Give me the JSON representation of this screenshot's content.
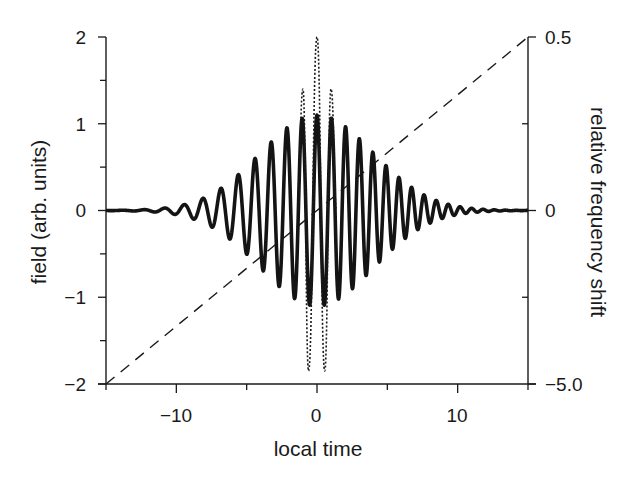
{
  "chart_data": {
    "type": "line",
    "title": "",
    "xlabel": "local time",
    "ylabel": "field (arb. units)",
    "ylabel_right": "relative frequency shift",
    "xlim": [
      -15,
      15
    ],
    "ylim": [
      -2,
      2
    ],
    "ylim_right_labels": [
      "-5.0",
      "0",
      "0.5"
    ],
    "grid": false,
    "legend": null,
    "x_ticks": [
      {
        "value": -10,
        "label": "−10"
      },
      {
        "value": 0,
        "label": "0"
      },
      {
        "value": 10,
        "label": "10"
      }
    ],
    "x_minor_ticks": [
      -15,
      -5,
      5,
      15
    ],
    "y_ticks": [
      {
        "value": 2,
        "label": "2"
      },
      {
        "value": 1,
        "label": "1"
      },
      {
        "value": 0,
        "label": "0"
      },
      {
        "value": -1,
        "label": "−1"
      },
      {
        "value": -2,
        "label": "−2"
      }
    ],
    "y_minor_ticks": [
      1.5,
      0.5,
      -0.5,
      -1.5
    ],
    "y_right_ticks": [
      {
        "value": 2,
        "label": "0.5"
      },
      {
        "value": 0,
        "label": "0"
      },
      {
        "value": -2,
        "label": "−5.0"
      }
    ],
    "y_right_minor_ticks": [
      1,
      -1
    ],
    "series": [
      {
        "name": "chirped pulse field",
        "style": "solid-thick",
        "model": "A*exp(-t^2/(2*sigma^2))*cos(w0*t + 0.5*beta*t^2)",
        "params": {
          "A": 1.1,
          "sigma": 4.0,
          "w0": 6.03,
          "beta": 0.15
        },
        "t_range": [
          -15,
          15
        ],
        "approx_peaks": [
          {
            "t": -9.4,
            "v": 0.1
          },
          {
            "t": -8.1,
            "v": 0.2
          },
          {
            "t": -6.8,
            "v": 0.4
          },
          {
            "t": -5.4,
            "v": 0.55
          },
          {
            "t": -4.2,
            "v": 0.72
          },
          {
            "t": -3.0,
            "v": 0.9
          },
          {
            "t": -2.0,
            "v": 1.0
          },
          {
            "t": -1.0,
            "v": 1.08
          },
          {
            "t": 0.0,
            "v": 1.1
          },
          {
            "t": 1.0,
            "v": 1.08
          },
          {
            "t": 2.0,
            "v": 0.98
          },
          {
            "t": 2.9,
            "v": 0.88
          },
          {
            "t": 3.8,
            "v": 0.75
          },
          {
            "t": 4.7,
            "v": 0.62
          },
          {
            "t": 5.6,
            "v": 0.48
          },
          {
            "t": 6.5,
            "v": 0.35
          },
          {
            "t": 7.3,
            "v": 0.22
          },
          {
            "t": 8.1,
            "v": 0.12
          },
          {
            "t": 9.0,
            "v": 0.06
          }
        ]
      },
      {
        "name": "compressed pulse field",
        "style": "dotted",
        "points": [
          {
            "t": -1.4,
            "v": 0
          },
          {
            "t": -1.0,
            "v": 1.4
          },
          {
            "t": -0.6,
            "v": -1.85
          },
          {
            "t": 0.0,
            "v": 2.0
          },
          {
            "t": 0.55,
            "v": -1.85
          },
          {
            "t": 1.0,
            "v": 1.4
          },
          {
            "t": 1.4,
            "v": 0
          }
        ]
      },
      {
        "name": "relative frequency shift",
        "style": "dashed",
        "axis": "right",
        "points": [
          {
            "t": -15,
            "v": -2
          },
          {
            "t": 15,
            "v": 2
          }
        ]
      }
    ]
  }
}
